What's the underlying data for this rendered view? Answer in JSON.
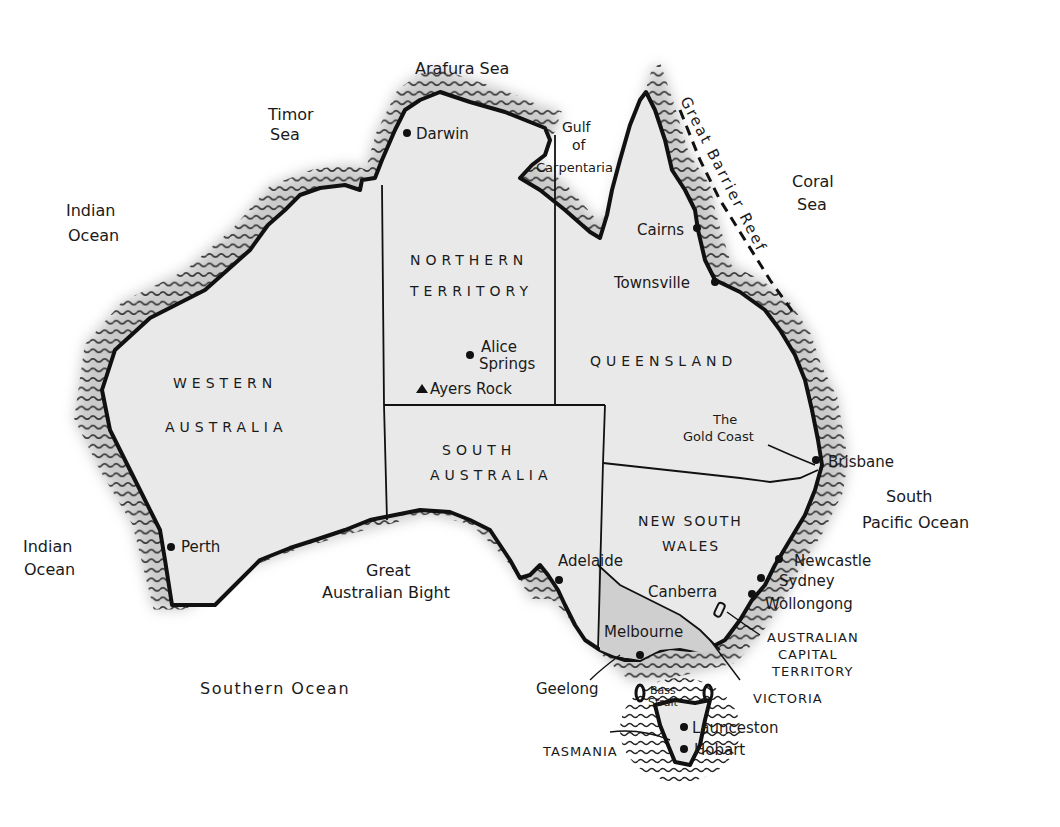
{
  "map": {
    "title": "Australia",
    "colors": {
      "land": "#e9e9e9",
      "victoria": "#cfcfcf",
      "coast": "#111111",
      "water_hatch": "#222222",
      "background": "#ffffff"
    },
    "seas": {
      "arafura": "Arafura Sea",
      "timor_1": "Timor",
      "timor_2": "Sea",
      "indian_n_1": "Indian",
      "indian_n_2": "Ocean",
      "indian_s_1": "Indian",
      "indian_s_2": "Ocean",
      "gulf_1": "Gulf",
      "gulf_2": "of",
      "gulf_3": "Carpentaria",
      "coral_1": "Coral",
      "coral_2": "Sea",
      "reef": "Great Barrier Reef",
      "south_pacific_1": "South",
      "south_pacific_2": "Pacific Ocean",
      "bight_1": "Great",
      "bight_2": "Australian Bight",
      "southern": "Southern Ocean",
      "bass_1": "Bass",
      "bass_2": "Strait"
    },
    "states": {
      "nt_1": "NORTHERN",
      "nt_2": "TERRITORY",
      "wa_1": "WESTERN",
      "wa_2": "AUSTRALIA",
      "qld": "QUEENSLAND",
      "sa_1": "SOUTH",
      "sa_2": "AUSTRALIA",
      "nsw_1": "NEW SOUTH",
      "nsw_2": "WALES",
      "act_1": "AUSTRALIAN",
      "act_2": "CAPITAL",
      "act_3": "TERRITORY",
      "vic": "VICTORIA",
      "tas": "TASMANIA"
    },
    "cities": {
      "darwin": "Darwin",
      "cairns": "Cairns",
      "townsville": "Townsville",
      "alice_1": "Alice",
      "alice_2": "Springs",
      "ayers": "Ayers Rock",
      "gold_1": "The",
      "gold_2": "Gold Coast",
      "brisbane": "Brisbane",
      "newcastle": "Newcastle",
      "sydney": "Sydney",
      "wollongong": "Wollongong",
      "canberra": "Canberra",
      "adelaide": "Adelaide",
      "melbourne": "Melbourne",
      "geelong": "Geelong",
      "launceston": "Launceston",
      "hobart": "Hobart",
      "perth": "Perth"
    }
  }
}
